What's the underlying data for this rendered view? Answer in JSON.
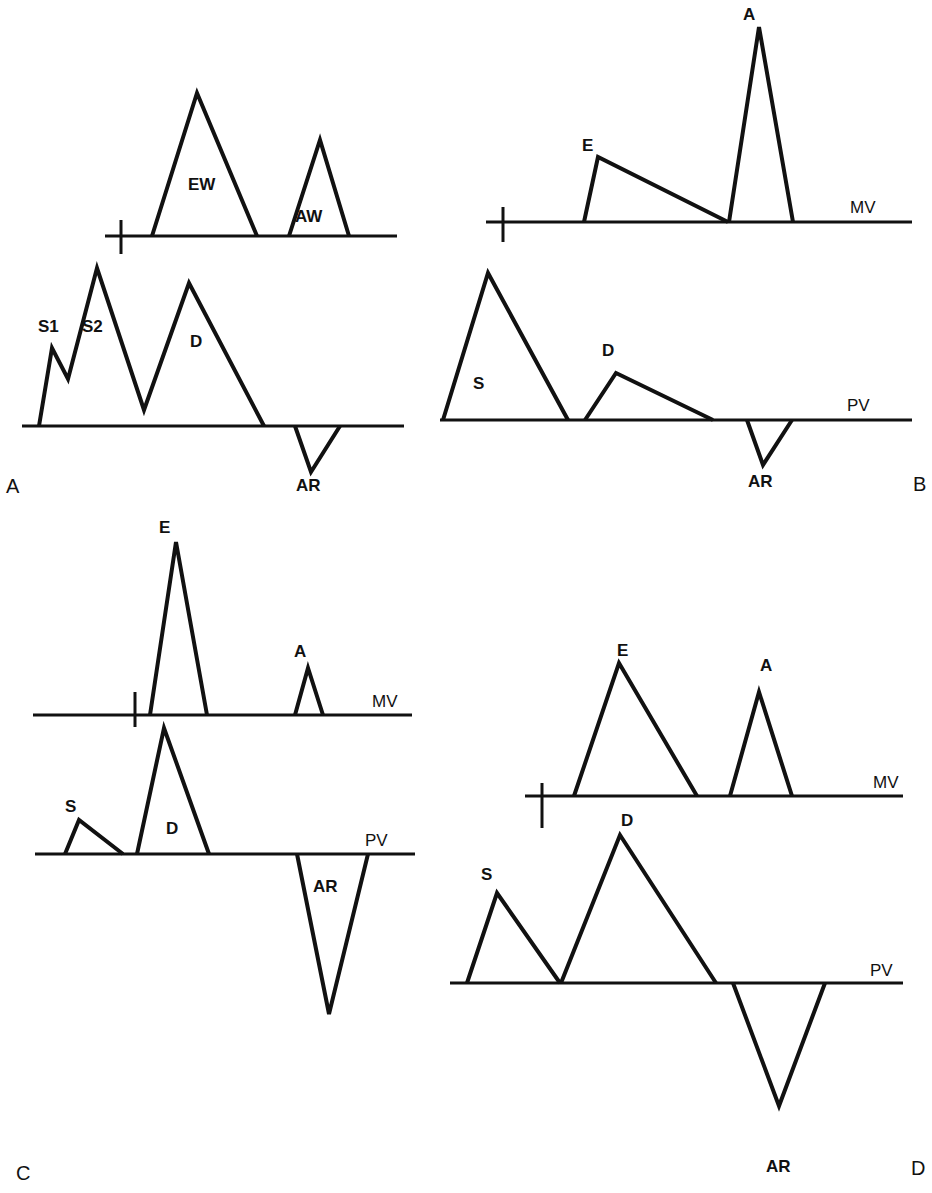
{
  "figure": {
    "panels": [
      {
        "id": "A",
        "label": "A",
        "upper_trace": {
          "label": "",
          "waves": [
            {
              "name": "EW",
              "label": "EW",
              "points": [
                [
                  152,
                  236
                ],
                [
                  197,
                  93
                ],
                [
                  257,
                  236
                ]
              ]
            },
            {
              "name": "AW",
              "label": "AW",
              "points": [
                [
                  289,
                  236
                ],
                [
                  320,
                  140
                ],
                [
                  349,
                  236
                ]
              ]
            }
          ]
        },
        "lower_trace": {
          "label": "",
          "waves": [
            {
              "name": "S1",
              "label": "S1"
            },
            {
              "name": "S2",
              "label": "S2"
            },
            {
              "name": "D",
              "label": "D"
            },
            {
              "name": "AR",
              "label": "AR",
              "points": [
                [
                  295,
                  426
                ],
                [
                  311,
                  472
                ],
                [
                  340,
                  426
                ]
              ]
            }
          ],
          "systolic_diastolic_polyline": [
            [
              39,
              426
            ],
            [
              52,
              348
            ],
            [
              68,
              379
            ],
            [
              97,
              268
            ],
            [
              144,
              410
            ],
            [
              189,
              283
            ],
            [
              264,
              426
            ]
          ]
        }
      },
      {
        "id": "B",
        "label": "B",
        "upper_trace": {
          "label": "MV",
          "waves": [
            {
              "name": "E",
              "label": "E",
              "points": [
                [
                  584,
                  222
                ],
                [
                  598,
                  157
                ],
                [
                  728,
                  222
                ]
              ]
            },
            {
              "name": "A",
              "label": "A",
              "points": [
                [
                  729,
                  222
                ],
                [
                  759,
                  27
                ],
                [
                  793,
                  222
                ]
              ]
            }
          ]
        },
        "lower_trace": {
          "label": "PV",
          "waves": [
            {
              "name": "S",
              "label": "S",
              "points": [
                [
                  443,
                  420
                ],
                [
                  488,
                  273
                ],
                [
                  568,
                  420
                ]
              ]
            },
            {
              "name": "D",
              "label": "D",
              "points": [
                [
                  585,
                  420
                ],
                [
                  616,
                  373
                ],
                [
                  713,
                  420
                ]
              ]
            },
            {
              "name": "AR",
              "label": "AR",
              "points": [
                [
                  747,
                  420
                ],
                [
                  763,
                  465
                ],
                [
                  792,
                  420
                ]
              ]
            }
          ]
        }
      },
      {
        "id": "C",
        "label": "C",
        "upper_trace": {
          "label": "MV",
          "waves": [
            {
              "name": "E",
              "label": "E",
              "points": [
                [
                  150,
                  715
                ],
                [
                  176,
                  542
                ],
                [
                  207,
                  715
                ]
              ]
            },
            {
              "name": "A",
              "label": "A",
              "points": [
                [
                  295,
                  715
                ],
                [
                  308,
                  668
                ],
                [
                  323,
                  715
                ]
              ]
            }
          ]
        },
        "lower_trace": {
          "label": "PV",
          "waves": [
            {
              "name": "S",
              "label": "S",
              "points": [
                [
                  65,
                  854
                ],
                [
                  79,
                  820
                ],
                [
                  123,
                  854
                ]
              ]
            },
            {
              "name": "D",
              "label": "D",
              "points": [
                [
                  137,
                  854
                ],
                [
                  164,
                  728
                ],
                [
                  209,
                  854
                ]
              ]
            },
            {
              "name": "AR",
              "label": "AR",
              "points": [
                [
                  297,
                  854
                ],
                [
                  329,
                  1014
                ],
                [
                  368,
                  854
                ]
              ]
            }
          ]
        }
      },
      {
        "id": "D",
        "label": "D",
        "upper_trace": {
          "label": "MV",
          "waves": [
            {
              "name": "E",
              "label": "E",
              "points": [
                [
                  574,
                  796
                ],
                [
                  619,
                  663
                ],
                [
                  697,
                  796
                ]
              ]
            },
            {
              "name": "A",
              "label": "A",
              "points": [
                [
                  730,
                  796
                ],
                [
                  759,
                  692
                ],
                [
                  792,
                  796
                ]
              ]
            }
          ]
        },
        "lower_trace": {
          "label": "PV",
          "waves": [
            {
              "name": "S",
              "label": "S",
              "points": [
                [
                  467,
                  983
                ],
                [
                  497,
                  893
                ],
                [
                  560,
                  983
                ]
              ]
            },
            {
              "name": "D",
              "label": "D",
              "points": [
                [
                  561,
                  983
                ],
                [
                  620,
                  835
                ],
                [
                  716,
                  983
                ]
              ]
            },
            {
              "name": "AR",
              "label": "AR",
              "points": [
                [
                  733,
                  983
                ],
                [
                  779,
                  1106
                ],
                [
                  825,
                  983
                ]
              ]
            }
          ]
        }
      }
    ]
  }
}
